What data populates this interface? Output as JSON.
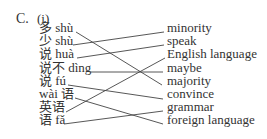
{
  "exercise": {
    "section_label": "C.",
    "part_label": "(i)",
    "left_items": [
      {
        "text": "多 shù",
        "y": 27
      },
      {
        "text": "少 shù",
        "y": 40
      },
      {
        "text": "说 huà",
        "y": 53
      },
      {
        "text": "说不 dìng",
        "y": 67
      },
      {
        "text": "说 fú",
        "y": 80
      },
      {
        "text": "wài 语",
        "y": 93
      },
      {
        "text": "英语",
        "y": 106
      },
      {
        "text": "语 fǎ",
        "y": 119
      }
    ],
    "right_items": [
      {
        "text": "minority",
        "y": 27
      },
      {
        "text": "speak",
        "y": 40
      },
      {
        "text": "English language",
        "y": 53
      },
      {
        "text": "maybe",
        "y": 67
      },
      {
        "text": "majority",
        "y": 80
      },
      {
        "text": "convince",
        "y": 93
      },
      {
        "text": "grammar",
        "y": 106
      },
      {
        "text": "foreign language",
        "y": 119
      }
    ],
    "matches": [
      {
        "left": 0,
        "right": 4,
        "x1": 76,
        "y1": 32,
        "x2": 162,
        "y2": 85
      },
      {
        "left": 1,
        "right": 0,
        "x1": 73,
        "y1": 45,
        "x2": 164,
        "y2": 32
      },
      {
        "left": 2,
        "right": 1,
        "x1": 77,
        "y1": 58,
        "x2": 164,
        "y2": 45
      },
      {
        "left": 3,
        "right": 3,
        "x1": 90,
        "y1": 72,
        "x2": 163,
        "y2": 72
      },
      {
        "left": 4,
        "right": 5,
        "x1": 68,
        "y1": 85,
        "x2": 163,
        "y2": 99
      },
      {
        "left": 5,
        "right": 7,
        "x1": 75,
        "y1": 98,
        "x2": 163,
        "y2": 124
      },
      {
        "left": 6,
        "right": 2,
        "x1": 66,
        "y1": 112,
        "x2": 165,
        "y2": 58
      },
      {
        "left": 7,
        "right": 6,
        "x1": 64,
        "y1": 124,
        "x2": 163,
        "y2": 111
      }
    ]
  }
}
